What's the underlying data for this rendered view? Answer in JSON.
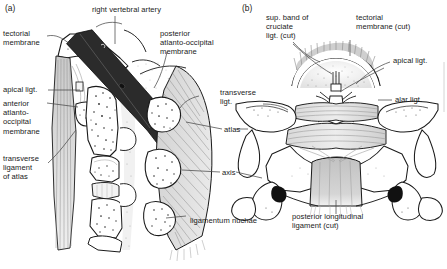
{
  "figure": {
    "panels": [
      {
        "tag": "(a)",
        "name": "median sagittal section"
      },
      {
        "tag": "(b)",
        "name": "posterior view, vertebral canal opened"
      }
    ],
    "colors": {
      "ink": "#1a1a1a",
      "background": "#ffffff",
      "bone_fill": "#ffffff",
      "membrane_grey": "#b9b9b9",
      "ligament_grey": "#cccccc",
      "artery_dark": "#2b2b2b",
      "leader_line": "#4a4a4a",
      "stipple": "#707070"
    }
  },
  "panel_a": {
    "tag": "(a)",
    "labels": {
      "tectorial_membrane": "tectorial\nmembrane",
      "apical_ligament": "apical ligt.",
      "anterior_atlanto_occipital_membrane": "anterior\natlanto-\noccipital\nmembrane",
      "transverse_ligament_of_atlas": "transverse\nligament\nof atlas",
      "right_vertebral_artery": "right vertebral artery",
      "posterior_atlanto_occipital_membrane": "posterior\natlanto-occipital\nmembrane",
      "ligamentum_nuchae": "ligamentum nuchae"
    }
  },
  "panel_b": {
    "tag": "(b)",
    "labels": {
      "sup_band_cruciate": "sup. band of\ncruciate\nligt. (cut)",
      "tectorial_membrane_cut": "tectorial\nmembrane (cut)",
      "apical_ligament": "apical ligt.",
      "alar_ligament": "alar ligt.",
      "posterior_longitudinal_ligament_cut": "posterior longitudinal\nligament (cut)"
    }
  },
  "shared_labels": {
    "transverse_ligament": "transverse\nligt.",
    "atlas": "atlas",
    "axis": "axis"
  }
}
